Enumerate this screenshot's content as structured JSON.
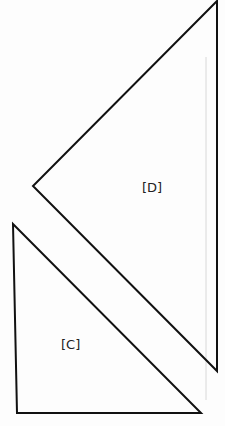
{
  "diagram": {
    "colors": {
      "background": "#fdfdfd",
      "stroke": "#111111",
      "guide": "#d8d8d8",
      "label": "#222222"
    },
    "shapes": [
      {
        "id": "D",
        "label": "[D]",
        "type": "triangle",
        "points": [
          [
            217,
            1
          ],
          [
            33,
            186
          ],
          [
            217,
            371
          ]
        ],
        "label_pos": [
          142,
          192
        ]
      },
      {
        "id": "C",
        "label": "[C]",
        "type": "triangle",
        "points": [
          [
            13,
            224
          ],
          [
            17,
            413
          ],
          [
            201,
            413
          ]
        ],
        "label_pos": [
          61,
          349
        ]
      }
    ],
    "guide_line": {
      "x": 206,
      "y1": 57,
      "y2": 400
    }
  }
}
